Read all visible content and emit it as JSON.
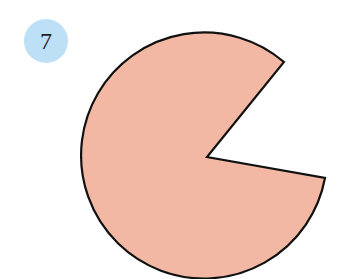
{
  "badge": {
    "number": "7",
    "color": "#bde0f7"
  },
  "figure": {
    "shape": "circle-with-missing-sector",
    "fill": "#f2b8a4",
    "stroke": "#111111"
  }
}
